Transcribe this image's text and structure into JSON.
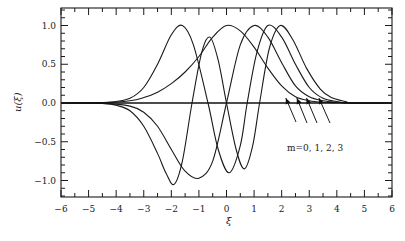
{
  "chart_data": {
    "type": "line",
    "title": "",
    "xlabel": "ξ",
    "ylabel": "u(ξ)",
    "xlim": [
      -6,
      6
    ],
    "ylim": [
      -1.2,
      1.2
    ],
    "x_ticks": [
      -6,
      -5,
      -4,
      -3,
      -2,
      -1,
      0,
      1,
      2,
      3,
      4,
      5,
      6
    ],
    "x_tick_labels": [
      "−6",
      "−5",
      "−4",
      "−3",
      "−2",
      "−1",
      "0",
      "1",
      "2",
      "3",
      "4",
      "5",
      "6"
    ],
    "y_ticks": [
      -1.0,
      -0.5,
      0.0,
      0.5,
      1.0
    ],
    "y_tick_labels": [
      "−1.0",
      "−0.5",
      "0.0",
      "0.5",
      "1.0"
    ],
    "grid": false,
    "legend": null,
    "annotation": {
      "text": "m=0, 1, 2, 3",
      "arrows_point_to_xi": [
        2.15,
        2.55,
        2.9,
        3.35
      ]
    },
    "series": [
      {
        "name": "m=0",
        "x": [
          -6,
          -4.5,
          -3.5,
          -3,
          -2.5,
          -2,
          -1.5,
          -1,
          -0.5,
          0,
          0.5,
          1,
          1.5,
          2,
          2.5,
          3,
          3.5,
          4,
          4.5,
          6
        ],
        "values": [
          0,
          0.005,
          0.03,
          0.07,
          0.14,
          0.25,
          0.4,
          0.6,
          0.85,
          1.0,
          0.93,
          0.72,
          0.45,
          0.22,
          0.08,
          0.03,
          0.01,
          0.004,
          0,
          0
        ]
      },
      {
        "name": "m=1",
        "x": [
          -6,
          -4.5,
          -3.5,
          -3,
          -2.5,
          -2,
          -1.5,
          -1,
          -0.5,
          0,
          0.5,
          1,
          1.5,
          2,
          2.5,
          3,
          3.5,
          4,
          4.5,
          6
        ],
        "values": [
          0,
          -0.005,
          -0.04,
          -0.12,
          -0.3,
          -0.6,
          -0.88,
          -0.97,
          -0.75,
          0.0,
          0.75,
          1.0,
          0.85,
          0.52,
          0.22,
          0.08,
          0.03,
          0.01,
          0,
          0
        ]
      },
      {
        "name": "m=2",
        "x": [
          -6,
          -4.5,
          -4,
          -3.5,
          -3,
          -2.5,
          -2,
          -1.6,
          -1.2,
          -0.67,
          -0.3,
          0.1,
          0.5,
          0.75,
          1.1,
          1.5,
          2,
          2.5,
          3,
          3.5,
          4,
          4.5,
          6
        ],
        "values": [
          0,
          0.005,
          0.02,
          0.06,
          0.2,
          0.5,
          0.88,
          1.0,
          0.75,
          0.0,
          -0.6,
          -0.9,
          -0.55,
          0.0,
          0.65,
          1.0,
          0.85,
          0.5,
          0.2,
          0.06,
          0.02,
          0,
          0
        ]
      },
      {
        "name": "m=3",
        "x": [
          -6,
          -4.5,
          -4,
          -3.5,
          -3,
          -2.5,
          -2.2,
          -1.9,
          -1.6,
          -1.25,
          -0.9,
          -0.6,
          -0.3,
          0.0,
          0.35,
          0.65,
          0.95,
          1.2,
          1.55,
          1.95,
          2.4,
          2.9,
          3.4,
          3.8,
          4.3,
          4.6,
          6
        ],
        "values": [
          0,
          -0.005,
          -0.03,
          -0.1,
          -0.3,
          -0.65,
          -0.9,
          -1.05,
          -0.75,
          0.0,
          0.65,
          0.85,
          0.55,
          0.0,
          -0.6,
          -0.85,
          -0.55,
          0.0,
          0.7,
          1.0,
          0.82,
          0.45,
          0.18,
          0.07,
          0.02,
          0,
          0
        ]
      }
    ]
  }
}
